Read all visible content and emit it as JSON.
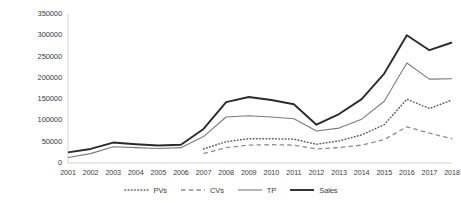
{
  "chart_data": {
    "type": "line",
    "title": "",
    "xlabel": "",
    "ylabel": "",
    "ylim": [
      0,
      350000
    ],
    "ytick_step": 50000,
    "grid": false,
    "legend_position": "bottom",
    "categories": [
      "2001",
      "2002",
      "2003",
      "2004",
      "2005",
      "2006",
      "2007",
      "2008",
      "2009",
      "2010",
      "2011",
      "2012",
      "2013",
      "2014",
      "2015",
      "2016",
      "2017",
      "2018"
    ],
    "ytick_labels": [
      "0",
      "50000",
      "100000",
      "150000",
      "200000",
      "250000",
      "300000",
      "350000"
    ],
    "series": [
      {
        "name": "PVs",
        "style": "dotted",
        "color": "#5a5a5a",
        "values": [
          null,
          null,
          null,
          null,
          null,
          null,
          33000,
          50000,
          57000,
          57000,
          56000,
          44000,
          52000,
          66000,
          90000,
          150000,
          128000,
          148000
        ]
      },
      {
        "name": "CVs",
        "style": "dashed",
        "color": "#8c8c8c",
        "values": [
          null,
          null,
          null,
          null,
          null,
          null,
          22000,
          36000,
          42000,
          43000,
          42000,
          33000,
          36000,
          42000,
          55000,
          85000,
          70000,
          57000
        ]
      },
      {
        "name": "TP",
        "style": "solid-thin",
        "color": "#7a7a7a",
        "values": [
          13000,
          22000,
          38000,
          36000,
          34000,
          36000,
          62000,
          108000,
          111000,
          108000,
          104000,
          75000,
          82000,
          103000,
          145000,
          235000,
          197000,
          198000
        ]
      },
      {
        "name": "Sales",
        "style": "solid-thick",
        "color": "#2b2b2b",
        "values": [
          25000,
          33000,
          48000,
          44000,
          41000,
          43000,
          80000,
          143000,
          155000,
          148000,
          138000,
          90000,
          115000,
          150000,
          210000,
          300000,
          265000,
          283000
        ]
      }
    ]
  }
}
